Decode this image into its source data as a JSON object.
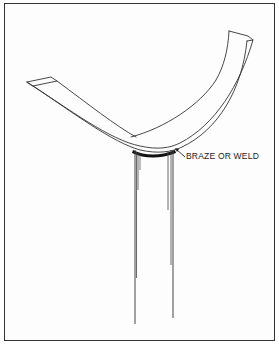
{
  "figure": {
    "type": "technical-illustration",
    "annotations": [
      {
        "id": "joint-label",
        "text": "BRAZE OR WELD"
      }
    ],
    "colors": {
      "line": "#333333",
      "weld": "#111111",
      "background": "#ffffff"
    }
  }
}
